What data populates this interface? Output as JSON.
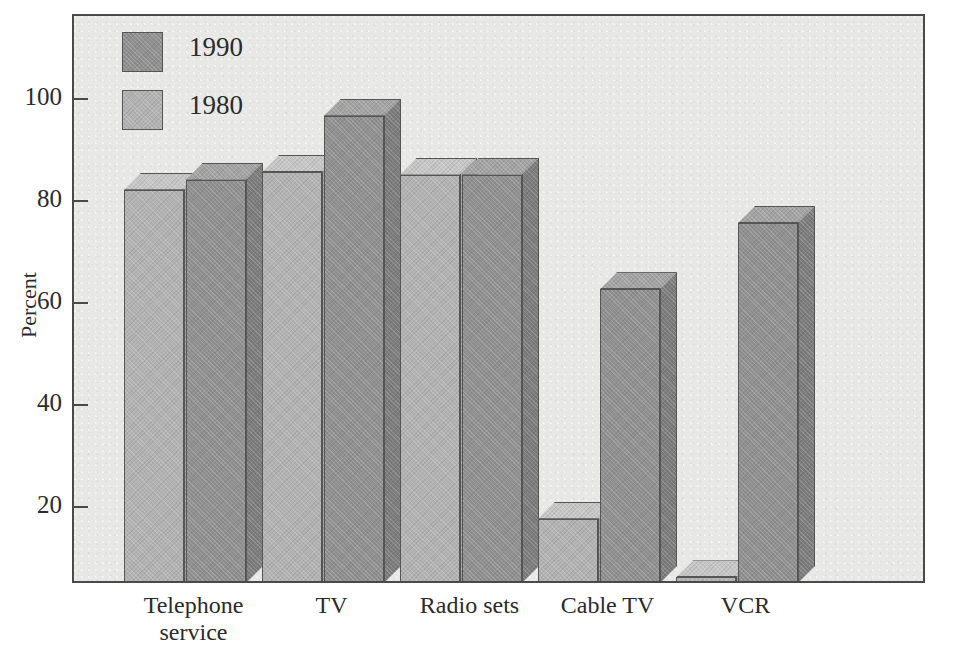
{
  "chart_data": {
    "type": "bar",
    "title": "",
    "subtitle": "",
    "xlabel": "",
    "ylabel": "Percent",
    "categories": [
      "Telephone\nservice",
      "TV",
      "Radio sets",
      "Cable TV",
      "VCR"
    ],
    "series": [
      {
        "name": "1990",
        "color": "#909090",
        "values": [
          84,
          96.5,
          85,
          62.5,
          75.5
        ]
      },
      {
        "name": "1980",
        "color": "#b2b2b2",
        "values": [
          82,
          85.5,
          85,
          17.5,
          6
        ]
      }
    ],
    "series_draw_order": [
      "1980",
      "1990"
    ],
    "ylim": [
      0,
      115
    ],
    "yticks": [
      20,
      40,
      60,
      80,
      100
    ],
    "ytick_labels": [
      "20",
      "40",
      "60",
      "80",
      "100"
    ],
    "grid": false,
    "legend_position": "top-left",
    "three_d": true
  },
  "legend": {
    "entries": [
      {
        "label": "1990",
        "swatch_color": "#909090"
      },
      {
        "label": "1980",
        "swatch_color": "#b2b2b2"
      }
    ]
  },
  "axes": {
    "y_title": "Percent",
    "y_tick_labels": [
      "100",
      "80",
      "60",
      "40",
      "20"
    ],
    "x_tick_labels": [
      "Telephone\nservice",
      "TV",
      "Radio sets",
      "Cable TV",
      "VCR"
    ]
  },
  "colors": {
    "plot_background": "#e8e8e6",
    "frame": "#4a4a4a",
    "text": "#2b2b2b",
    "bar_1990_face": "#909090",
    "bar_1990_top": "#a3a3a3",
    "bar_1990_side": "#7c7c7c",
    "bar_1980_face": "#b2b2b2",
    "bar_1980_top": "#c6c6c6",
    "bar_1980_side": "#9e9e9e"
  }
}
